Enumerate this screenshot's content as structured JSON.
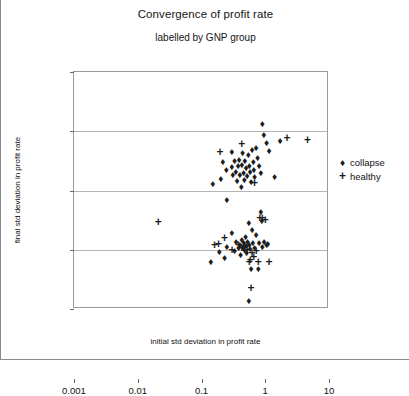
{
  "chart_data": {
    "type": "scatter",
    "title": "Convergence of profit rate",
    "subtitle": "labelled by GNP group",
    "xlabel": "initial std deviation in profit rate",
    "ylabel": "final std deviation in profit rate",
    "xscale": "log",
    "yscale": "log",
    "xlim": [
      0.001,
      10
    ],
    "ylim": [
      0.001,
      10
    ],
    "xticks": [
      "0.001",
      "0.01",
      "0.1",
      "1",
      "10"
    ],
    "yticks": [
      "0.001",
      "0.01",
      "0.1",
      "1",
      "10"
    ],
    "grid": true,
    "legend_position": "right",
    "series": [
      {
        "name": "collapse",
        "marker": "diamond",
        "marker_glyph": "♦",
        "color": "#1c1c1c",
        "points": [
          [
            0.15,
            0.13
          ],
          [
            0.2,
            0.155
          ],
          [
            0.215,
            0.3
          ],
          [
            0.245,
            0.225
          ],
          [
            0.25,
            0.07
          ],
          [
            0.3,
            0.44
          ],
          [
            0.3,
            0.25
          ],
          [
            0.31,
            0.18
          ],
          [
            0.33,
            0.31
          ],
          [
            0.345,
            0.205
          ],
          [
            0.36,
            0.145
          ],
          [
            0.375,
            0.255
          ],
          [
            0.39,
            0.33
          ],
          [
            0.4,
            0.185
          ],
          [
            0.42,
            0.115
          ],
          [
            0.43,
            0.27
          ],
          [
            0.44,
            0.425
          ],
          [
            0.455,
            0.2
          ],
          [
            0.47,
            0.15
          ],
          [
            0.48,
            0.32
          ],
          [
            0.5,
            0.24
          ],
          [
            0.52,
            0.175
          ],
          [
            0.54,
            0.39
          ],
          [
            0.56,
            0.26
          ],
          [
            0.58,
            0.205
          ],
          [
            0.6,
            0.14
          ],
          [
            0.62,
            0.48
          ],
          [
            0.65,
            0.3
          ],
          [
            0.66,
            0.225
          ],
          [
            0.68,
            0.17
          ],
          [
            0.72,
            0.53
          ],
          [
            0.76,
            0.36
          ],
          [
            0.8,
            0.26
          ],
          [
            0.85,
            0.195
          ],
          [
            0.9,
            1.3
          ],
          [
            0.95,
            0.88
          ],
          [
            1.05,
            0.64
          ],
          [
            1.15,
            0.47
          ],
          [
            1.4,
            0.17
          ],
          [
            1.7,
            0.69
          ],
          [
            0.14,
            0.0062
          ],
          [
            0.19,
            0.009
          ],
          [
            0.23,
            0.0072
          ],
          [
            0.25,
            0.0112
          ],
          [
            0.3,
            0.0195
          ],
          [
            0.33,
            0.0095
          ],
          [
            0.35,
            0.0135
          ],
          [
            0.38,
            0.0108
          ],
          [
            0.4,
            0.0118
          ],
          [
            0.41,
            0.0082
          ],
          [
            0.43,
            0.0145
          ],
          [
            0.45,
            0.0105
          ],
          [
            0.46,
            0.0128
          ],
          [
            0.47,
            0.0098
          ],
          [
            0.49,
            0.0165
          ],
          [
            0.5,
            0.0115
          ],
          [
            0.51,
            0.0088
          ],
          [
            0.53,
            0.0135
          ],
          [
            0.55,
            0.028
          ],
          [
            0.56,
            0.012
          ],
          [
            0.58,
            0.0102
          ],
          [
            0.6,
            0.0048
          ],
          [
            0.62,
            0.0215
          ],
          [
            0.64,
            0.0128
          ],
          [
            0.68,
            0.0108
          ],
          [
            0.72,
            0.018
          ],
          [
            0.78,
            0.0048
          ],
          [
            0.8,
            0.0128
          ],
          [
            0.85,
            0.044
          ],
          [
            0.88,
            0.03
          ],
          [
            0.9,
            0.0112
          ],
          [
            0.96,
            0.0135
          ],
          [
            1.05,
            0.0118
          ],
          [
            1.1,
            0.0125
          ],
          [
            0.55,
            0.00135
          ]
        ]
      },
      {
        "name": "healthy",
        "marker": "plus",
        "marker_glyph": "+",
        "color": "#1c1c1c",
        "points": [
          [
            0.021,
            0.0295
          ],
          [
            0.195,
            0.45
          ],
          [
            0.43,
            0.6
          ],
          [
            0.68,
            0.132
          ],
          [
            4.6,
            0.7
          ],
          [
            2.2,
            0.76
          ],
          [
            0.16,
            0.0118
          ],
          [
            0.185,
            0.0125
          ],
          [
            0.23,
            0.016
          ],
          [
            0.3,
            0.01
          ],
          [
            0.38,
            0.0122
          ],
          [
            0.43,
            0.0108
          ],
          [
            0.47,
            0.0115
          ],
          [
            0.52,
            0.0098
          ],
          [
            0.56,
            0.0062
          ],
          [
            0.58,
            0.0068
          ],
          [
            0.62,
            0.0088
          ],
          [
            0.66,
            0.0075
          ],
          [
            0.72,
            0.0095
          ],
          [
            0.78,
            0.0062
          ],
          [
            0.82,
            0.035
          ],
          [
            0.9,
            0.034
          ],
          [
            1.0,
            0.032
          ],
          [
            1.15,
            0.0062
          ],
          [
            0.6,
            0.00225
          ]
        ]
      }
    ]
  }
}
